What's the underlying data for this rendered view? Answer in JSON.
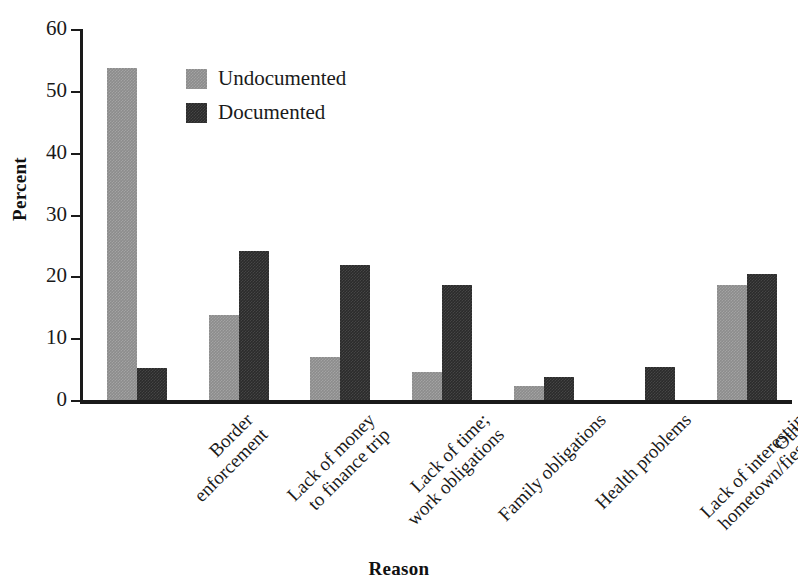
{
  "chart_data": {
    "type": "bar",
    "title": "",
    "xlabel": "Reason",
    "ylabel": "Percent",
    "ylim": [
      0,
      60
    ],
    "yticks": [
      0,
      10,
      20,
      30,
      40,
      50,
      60
    ],
    "grid": false,
    "legend_position": "upper-center-left",
    "categories": [
      "Border\nenforcement",
      "Lack of money\nto finance trip",
      "Lack of time;\nwork obligations",
      "Family obligations",
      "Health problems",
      "Lack of interest in\nhometown/fiestas",
      "Other"
    ],
    "category_lines": [
      [
        "Border",
        "enforcement"
      ],
      [
        "Lack of money",
        "to finance trip"
      ],
      [
        "Lack of time;",
        "work obligations"
      ],
      [
        "Family obligations"
      ],
      [
        "Health problems"
      ],
      [
        "Lack of interest in",
        "hometown/fiestas"
      ],
      [
        "Other"
      ]
    ],
    "series": [
      {
        "name": "Undocumented",
        "color": "#8c8c8c",
        "values": [
          53.7,
          13.8,
          7.0,
          4.5,
          2.3,
          0.0,
          18.6
        ]
      },
      {
        "name": "Documented",
        "color": "#2b2b2b",
        "values": [
          5.2,
          24.1,
          21.9,
          18.6,
          3.7,
          5.3,
          20.4
        ]
      }
    ]
  },
  "legend": {
    "items": [
      {
        "label": "Undocumented",
        "color": "#8c8c8c"
      },
      {
        "label": "Documented",
        "color": "#2b2b2b"
      }
    ]
  },
  "axes": {
    "y_title": "Percent",
    "x_title": "Reason",
    "y_tick_labels": [
      "0",
      "10",
      "20",
      "30",
      "40",
      "50",
      "60"
    ]
  }
}
